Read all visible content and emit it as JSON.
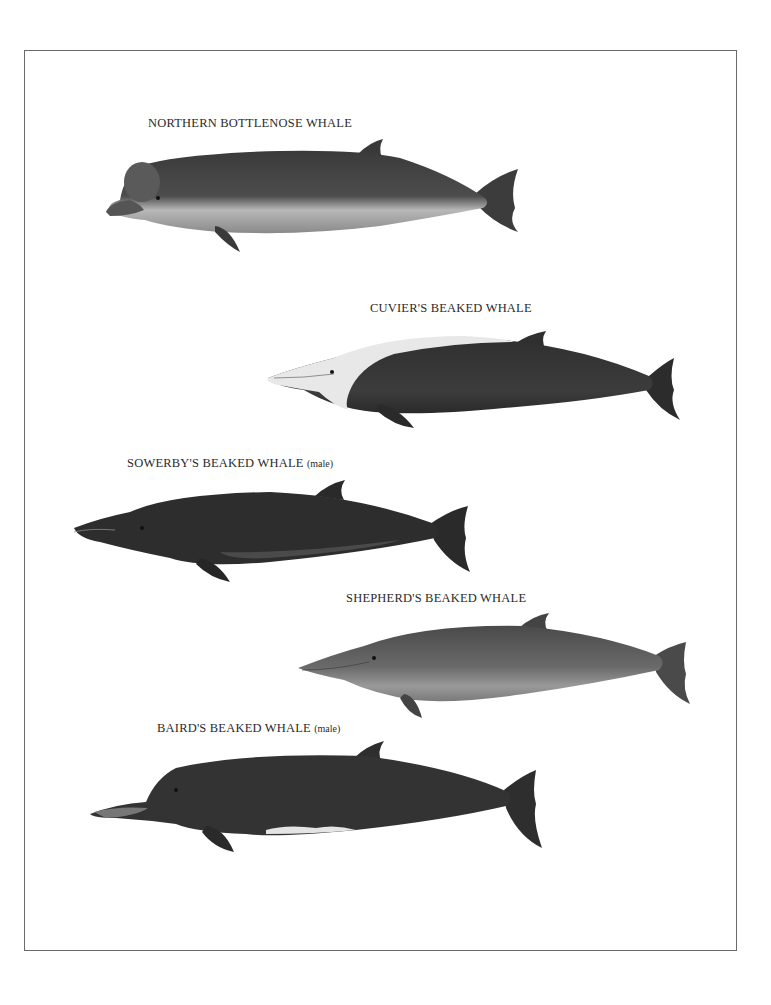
{
  "plate": {
    "frame_color": "#6a6a6a",
    "whales": [
      {
        "name": "NORTHERN BOTTLENOSE WHALE",
        "qualifier": ""
      },
      {
        "name": "CUVIER'S BEAKED WHALE",
        "qualifier": ""
      },
      {
        "name": "SOWERBY'S BEAKED WHALE",
        "qualifier": "(male)"
      },
      {
        "name": "SHEPHERD'S BEAKED WHALE",
        "qualifier": ""
      },
      {
        "name": "BAIRD'S BEAKED WHALE",
        "qualifier": "(male)"
      }
    ]
  }
}
